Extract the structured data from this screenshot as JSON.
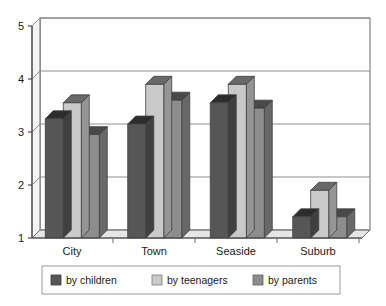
{
  "chart_data": {
    "type": "bar",
    "title": "",
    "subtitle": "",
    "xlabel": "",
    "ylabel": "",
    "categories": [
      "City",
      "Town",
      "Seaside",
      "Suburb"
    ],
    "series": [
      {
        "name": "by children",
        "values": [
          3.25,
          3.15,
          3.55,
          1.4
        ],
        "color": "#565656"
      },
      {
        "name": "by teenagers",
        "values": [
          3.55,
          3.9,
          3.9,
          1.9
        ],
        "color": "#c9c9c9"
      },
      {
        "name": "by parents",
        "values": [
          2.95,
          3.6,
          3.45,
          1.4
        ],
        "color": "#8d8d8d"
      }
    ],
    "ylim": [
      1,
      5
    ],
    "yticks": [
      1,
      2,
      3,
      4,
      5
    ],
    "ytick_labels": [
      "1",
      "2",
      "3",
      "4",
      "5"
    ],
    "grid": true,
    "grid_axis": "y",
    "legend_position": "bottom",
    "style": "3d-bar",
    "plot_bgcolor": "#ffffff",
    "grid_color": "#9a9a9a",
    "axis_color": "#555555",
    "legend_border_color": "#9a9a9a"
  }
}
